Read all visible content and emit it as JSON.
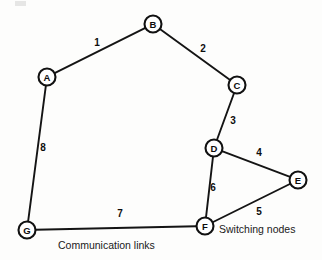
{
  "diagram": {
    "canvas": {
      "width": 322,
      "height": 260
    },
    "style": {
      "background": "#fdfdfc",
      "line_color": "#141414",
      "node_fill": "#ffffff",
      "node_stroke": "#111111",
      "text_color": "#0d0d0d",
      "node_radius": 8.5
    },
    "nodes": [
      {
        "id": "A",
        "label": "A",
        "x": 47,
        "y": 77
      },
      {
        "id": "B",
        "label": "B",
        "x": 153,
        "y": 24
      },
      {
        "id": "C",
        "label": "C",
        "x": 237,
        "y": 85
      },
      {
        "id": "D",
        "label": "D",
        "x": 214,
        "y": 148
      },
      {
        "id": "E",
        "label": "E",
        "x": 298,
        "y": 180
      },
      {
        "id": "F",
        "label": "F",
        "x": 205,
        "y": 226
      },
      {
        "id": "G",
        "label": "G",
        "x": 27,
        "y": 230
      }
    ],
    "edges": [
      {
        "id": "edge-1",
        "from": "A",
        "to": "B",
        "label": "1",
        "label_x": 97,
        "label_y": 42
      },
      {
        "id": "edge-2",
        "from": "B",
        "to": "C",
        "label": "2",
        "label_x": 203,
        "label_y": 48
      },
      {
        "id": "edge-3",
        "from": "C",
        "to": "D",
        "label": "3",
        "label_x": 233,
        "label_y": 120
      },
      {
        "id": "edge-4",
        "from": "D",
        "to": "E",
        "label": "4",
        "label_x": 259,
        "label_y": 152
      },
      {
        "id": "edge-5",
        "from": "E",
        "to": "F",
        "label": "5",
        "label_x": 259,
        "label_y": 211
      },
      {
        "id": "edge-6",
        "from": "D",
        "to": "F",
        "label": "6",
        "label_x": 213,
        "label_y": 187
      },
      {
        "id": "edge-7",
        "from": "G",
        "to": "F",
        "label": "7",
        "label_x": 120,
        "label_y": 213
      },
      {
        "id": "edge-8",
        "from": "A",
        "to": "G",
        "label": "8",
        "label_x": 43,
        "label_y": 147
      }
    ],
    "captions": [
      {
        "id": "communication-links",
        "text": "Communication links",
        "x": 58,
        "y": 245
      },
      {
        "id": "switching-nodes",
        "text": "Switching nodes",
        "x": 219,
        "y": 229
      }
    ]
  }
}
